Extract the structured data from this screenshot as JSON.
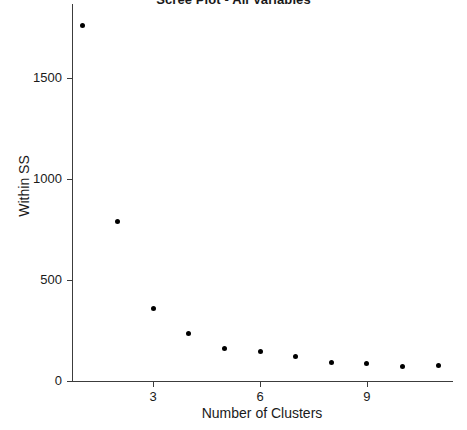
{
  "chart_data": {
    "type": "scatter",
    "title": "Scree Plot - All Variables",
    "xlabel": "Number of Clusters",
    "ylabel": "Within SS",
    "x": [
      1,
      2,
      3,
      4,
      5,
      6,
      7,
      8,
      9,
      10,
      11
    ],
    "values": [
      1762,
      792,
      361,
      233,
      163,
      144,
      119,
      94,
      89,
      74,
      79
    ],
    "categories": [
      "1",
      "2",
      "3",
      "4",
      "5",
      "6",
      "7",
      "8",
      "9",
      "10",
      "11"
    ],
    "series": [
      {
        "name": "Within SS",
        "values": [
          1762,
          792,
          361,
          233,
          163,
          144,
          119,
          94,
          89,
          74,
          79
        ]
      }
    ],
    "xlim": [
      0.55,
      11.6
    ],
    "ylim": [
      0,
      1870
    ],
    "x_ticks": [
      3,
      6,
      9
    ],
    "x_tick_labels": [
      "3",
      "6",
      "9"
    ],
    "y_ticks": [
      0,
      500,
      1000,
      1500
    ],
    "y_tick_labels": [
      "0",
      "500",
      "1000",
      "1500"
    ],
    "grid": false,
    "legend": "none",
    "marker": "filled-circle",
    "marker_color": "#000000",
    "axis_color": "#3c3c3c",
    "background": "#ffffff"
  }
}
